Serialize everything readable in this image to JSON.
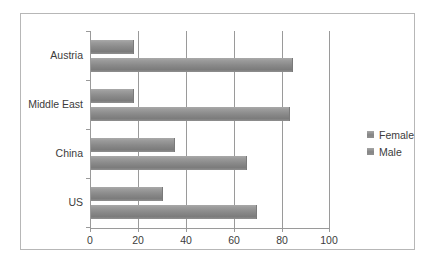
{
  "chart_data": {
    "type": "bar",
    "orientation": "horizontal",
    "title": "",
    "xlabel": "",
    "ylabel": "",
    "categories": [
      "US",
      "China",
      "Middle East",
      "Austria"
    ],
    "series": [
      {
        "name": "Male",
        "values": [
          69,
          65,
          83,
          84
        ]
      },
      {
        "name": "Female",
        "values": [
          30,
          35,
          18,
          18
        ]
      }
    ],
    "xlim": [
      0,
      100
    ],
    "xticks": [
      0,
      20,
      40,
      60,
      80,
      100
    ],
    "xtick_labels": [
      "0",
      "20",
      "40",
      "60",
      "80",
      "100"
    ],
    "grid": true,
    "grid_axis": "x",
    "legend": [
      "Female",
      "Male"
    ],
    "legend_position": "right",
    "colors": {
      "bar": "#8a8a8a",
      "axis": "#9a9a9a",
      "grid": "#9a9a9a",
      "text": "#3c3c3c",
      "frame": "#b7b7b7",
      "background": "#ffffff"
    }
  }
}
